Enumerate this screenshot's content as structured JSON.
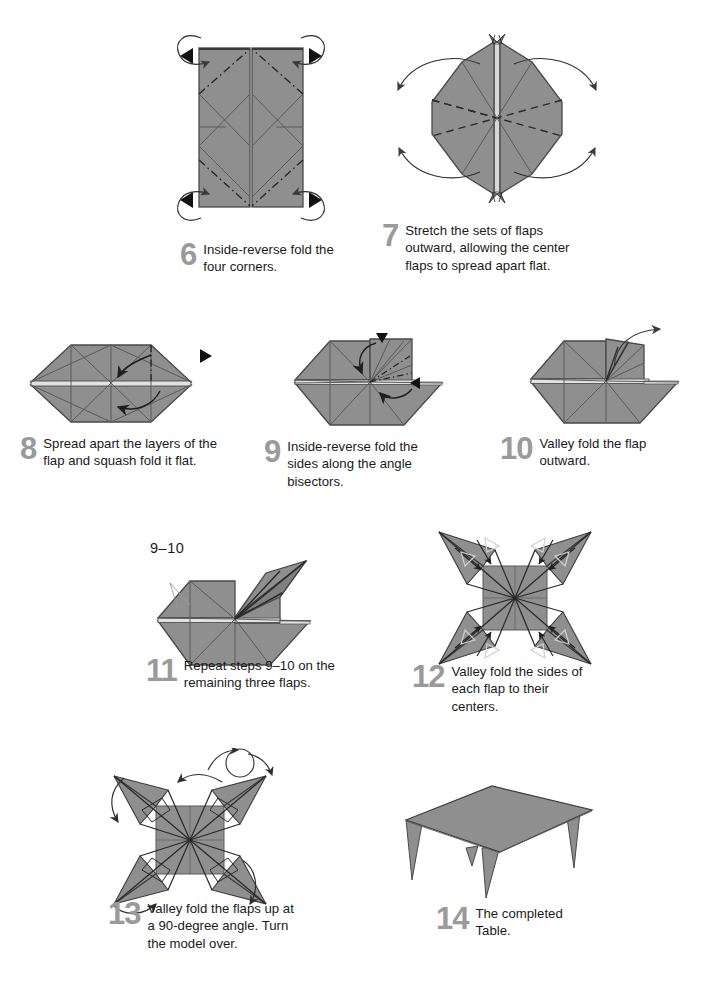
{
  "document": {
    "kind": "origami-instruction-page",
    "model_name": "Table",
    "paper_color": "#8f8f8f",
    "paper_edge_color": "#4a4a4a",
    "step_number_color": "#9a9a9a",
    "text_color": "#1a1a1a",
    "background_color": "#ffffff"
  },
  "steps": [
    {
      "number": "6",
      "text": "Inside-reverse fold the four corners.",
      "figure": "tall-rectangle-two-panels-with-reverse-fold-creases"
    },
    {
      "number": "7",
      "text": "Stretch the sets of flaps outward, allowing the center flaps to spread apart flat.",
      "figure": "elongated-hexagon-with-x-valley-creases"
    },
    {
      "number": "8",
      "text": "Spread apart the layers of the flap and squash fold it flat.",
      "figure": "wide-hexagon-with-squash-fold-arrows"
    },
    {
      "number": "9",
      "text": "Inside-reverse fold the sides along the angle bisectors.",
      "figure": "hexagon-with-raised-square-flap-and-bisector-creases"
    },
    {
      "number": "10",
      "text": "Valley fold the flap outward.",
      "figure": "hexagon-with-narrow-flap-and-outward-arrow"
    },
    {
      "number": "11",
      "text": "Repeat steps 9–10 on the remaining three flaps.",
      "figure": "hexagon-with-spread-point-flap",
      "callout": "9–10"
    },
    {
      "number": "12",
      "text": "Valley fold the sides of each flap to their centers.",
      "figure": "four-pointed-star-with-inward-arrows"
    },
    {
      "number": "13",
      "text": "Valley fold the flaps up at a 90-degree angle. Turn the model over.",
      "figure": "four-pointed-star-with-fold-up-arrows-and-turn-over-symbol"
    },
    {
      "number": "14",
      "text": "The completed Table.",
      "figure": "finished-table-3d-view"
    }
  ]
}
